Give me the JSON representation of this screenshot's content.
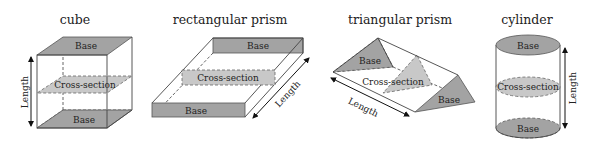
{
  "shapes": [
    {
      "name": "cube",
      "title": "cube",
      "labels": {
        "top_base": "Base",
        "cross_section": "Cross-section",
        "bottom_base": "Base",
        "length": "Length"
      }
    },
    {
      "name": "rectangular-prism",
      "title": "rectangular prism",
      "labels": {
        "back_base": "Base",
        "cross_section": "Cross-section",
        "front_base": "Base",
        "length": "Length"
      }
    },
    {
      "name": "triangular-prism",
      "title": "triangular prism",
      "labels": {
        "back_base": "Base",
        "cross_section": "Cross-section",
        "front_base": "Base",
        "length": "Length"
      }
    },
    {
      "name": "cylinder",
      "title": "cylinder",
      "labels": {
        "top_base": "Base",
        "cross_section": "Cross-section",
        "bottom_base": "Base",
        "length": "Length"
      }
    }
  ],
  "colors": {
    "base_fill": "#a3a3a3",
    "cross_section_fill": "#c8c8c8",
    "edge": "#444444"
  }
}
